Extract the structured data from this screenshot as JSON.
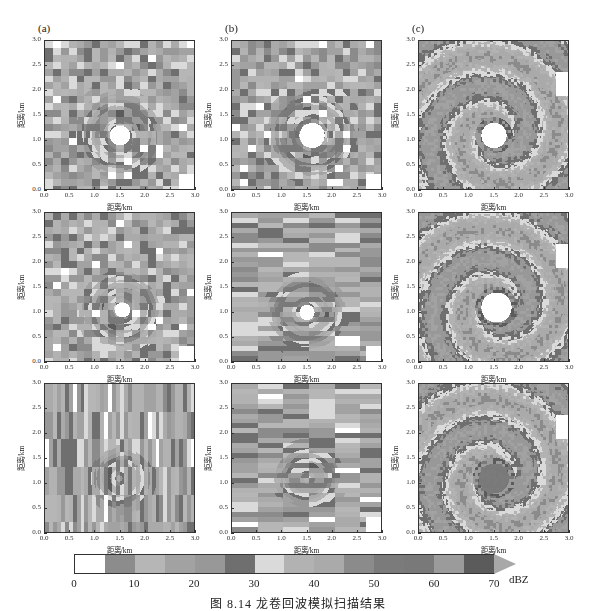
{
  "figure": {
    "caption": "图 8.14   龙卷回波模拟扫描结果",
    "panel_labels": [
      "(a)",
      "(b)",
      "(c)"
    ],
    "x_axis_label": "距离/km",
    "y_axis_label": "距离/km",
    "axis_ticks": [
      "0.0",
      "0.5",
      "1.0",
      "1.5",
      "2.0",
      "2.5",
      "3.0"
    ]
  },
  "colorbar": {
    "unit": "dBZ",
    "tick_labels": [
      "0",
      "10",
      "20",
      "30",
      "40",
      "50",
      "60",
      "70"
    ],
    "segments": [
      {
        "from": 0,
        "to": 5,
        "color": "#ffffff"
      },
      {
        "from": 5,
        "to": 10,
        "color": "#8c8c8c"
      },
      {
        "from": 10,
        "to": 15,
        "color": "#b6b6b6"
      },
      {
        "from": 15,
        "to": 20,
        "color": "#a2a2a2"
      },
      {
        "from": 20,
        "to": 25,
        "color": "#989898"
      },
      {
        "from": 25,
        "to": 30,
        "color": "#6f6f6f"
      },
      {
        "from": 30,
        "to": 35,
        "color": "#dadada"
      },
      {
        "from": 35,
        "to": 40,
        "color": "#b2b2b2"
      },
      {
        "from": 40,
        "to": 45,
        "color": "#aaaaaa"
      },
      {
        "from": 45,
        "to": 50,
        "color": "#8b8b8b"
      },
      {
        "from": 50,
        "to": 55,
        "color": "#7b7b7b"
      },
      {
        "from": 55,
        "to": 60,
        "color": "#797979"
      },
      {
        "from": 60,
        "to": 65,
        "color": "#9b9b9b"
      },
      {
        "from": 65,
        "to": 70,
        "color": "#5b5b5b"
      }
    ],
    "overflow_color": "#a8a8a8"
  },
  "chart_data": {
    "type": "heatmap",
    "title": "图 8.14 龙卷回波模拟扫描结果",
    "xlabel": "距离/km",
    "ylabel": "距离/km",
    "xlim": [
      0.0,
      3.0
    ],
    "ylim": [
      0.0,
      3.0
    ],
    "colorbar": {
      "label": "dBZ",
      "range": [
        0,
        70
      ],
      "step": 5,
      "extend": "max"
    },
    "layout": {
      "rows": 3,
      "cols": 3,
      "column_labels": [
        "(a)",
        "(b)",
        "(c)"
      ]
    },
    "panels": [
      {
        "row": 1,
        "col": "(a)",
        "pattern": "coarse blocky vortex ring",
        "eye_center_km": [
          1.5,
          1.1
        ],
        "eye_radius_km": 0.2
      },
      {
        "row": 1,
        "col": "(b)",
        "pattern": "blocky vortex ring, finer azimuthal bins",
        "eye_center_km": [
          1.6,
          1.1
        ],
        "eye_radius_km": 0.25
      },
      {
        "row": 1,
        "col": "(c)",
        "pattern": "smooth high-resolution vortex ring",
        "eye_center_km": [
          1.5,
          1.1
        ],
        "eye_radius_km": 0.25
      },
      {
        "row": 2,
        "col": "(a)",
        "pattern": "coarse blocky, weak eye",
        "eye_center_km": [
          1.55,
          1.05
        ],
        "eye_radius_km": 0.15
      },
      {
        "row": 2,
        "col": "(b)",
        "pattern": "horizontal-striped blocks, small eye",
        "eye_center_km": [
          1.5,
          1.0
        ],
        "eye_radius_km": 0.15
      },
      {
        "row": 2,
        "col": "(c)",
        "pattern": "smooth ring with irregular eye",
        "eye_center_km": [
          1.55,
          1.1
        ],
        "eye_radius_km": 0.3
      },
      {
        "row": 3,
        "col": "(a)",
        "pattern": "vertical-striped blocks, no clear eye"
      },
      {
        "row": 3,
        "col": "(b)",
        "pattern": "horizontal-striped columns, no clear eye"
      },
      {
        "row": 3,
        "col": "(c)",
        "pattern": "smooth ring with dark filled core",
        "eye_center_km": [
          1.5,
          1.1
        ],
        "eye_radius_km": 0.3
      }
    ]
  }
}
